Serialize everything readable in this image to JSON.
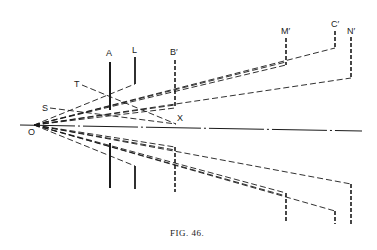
{
  "figure": {
    "caption": "Fig. 46.",
    "caption_display": "FIG. 46."
  },
  "labels": {
    "O": "O",
    "A": "A",
    "L": "L",
    "B": "B′",
    "M": "M′",
    "C": "C′",
    "N": "N′",
    "T": "T",
    "S": "S",
    "X": "X"
  },
  "colors": {
    "ink": "#1a1a1a",
    "background": "#ffffff"
  }
}
